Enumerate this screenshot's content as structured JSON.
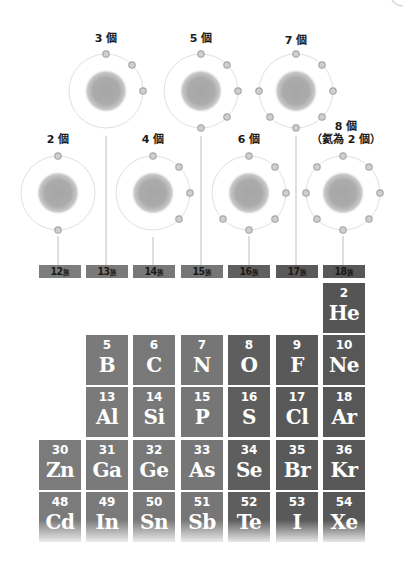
{
  "diagram": {
    "colors": {
      "orbit": "#dcdcdc",
      "nucleus": "#a8a8a8",
      "electron_fill": "#c8c8c8",
      "electron_stroke": "#a0a0a0",
      "connector": "#bdbdbd",
      "group_12": "#7d7d7d",
      "group_13": "#7a7a7a",
      "group_14": "#787878",
      "group_15": "#757575",
      "group_16": "#5c5c5c",
      "group_17": "#575757",
      "group_18": "#555555"
    },
    "atoms": [
      {
        "label": "2 個",
        "group": "12",
        "electrons": 2
      },
      {
        "label": "3 個",
        "group": "13",
        "electrons": 3
      },
      {
        "label": "4 個",
        "group": "14",
        "electrons": 4
      },
      {
        "label": "5 個",
        "group": "15",
        "electrons": 5
      },
      {
        "label": "6 個",
        "group": "16",
        "electrons": 6
      },
      {
        "label": "7 個",
        "group": "17",
        "electrons": 7
      },
      {
        "label": "8 個",
        "label_line2": "（氦為 2 個）",
        "group": "18",
        "electrons": 8
      }
    ],
    "groups": [
      {
        "number": "12",
        "suffix": "族"
      },
      {
        "number": "13",
        "suffix": "族"
      },
      {
        "number": "14",
        "suffix": "族"
      },
      {
        "number": "15",
        "suffix": "族"
      },
      {
        "number": "16",
        "suffix": "族"
      },
      {
        "number": "17",
        "suffix": "族"
      },
      {
        "number": "18",
        "suffix": "族"
      }
    ],
    "elements": {
      "row1": [
        {
          "num": "2",
          "sym": "He",
          "group": "18"
        }
      ],
      "row2": [
        {
          "num": "5",
          "sym": "B",
          "group": "13"
        },
        {
          "num": "6",
          "sym": "C",
          "group": "14"
        },
        {
          "num": "7",
          "sym": "N",
          "group": "15"
        },
        {
          "num": "8",
          "sym": "O",
          "group": "16"
        },
        {
          "num": "9",
          "sym": "F",
          "group": "17"
        },
        {
          "num": "10",
          "sym": "Ne",
          "group": "18"
        }
      ],
      "row3": [
        {
          "num": "13",
          "sym": "Al",
          "group": "13"
        },
        {
          "num": "14",
          "sym": "Si",
          "group": "14"
        },
        {
          "num": "15",
          "sym": "P",
          "group": "15"
        },
        {
          "num": "16",
          "sym": "S",
          "group": "16"
        },
        {
          "num": "17",
          "sym": "Cl",
          "group": "17"
        },
        {
          "num": "18",
          "sym": "Ar",
          "group": "18"
        }
      ],
      "row4": [
        {
          "num": "30",
          "sym": "Zn",
          "group": "12"
        },
        {
          "num": "31",
          "sym": "Ga",
          "group": "13"
        },
        {
          "num": "32",
          "sym": "Ge",
          "group": "14"
        },
        {
          "num": "33",
          "sym": "As",
          "group": "15"
        },
        {
          "num": "34",
          "sym": "Se",
          "group": "16"
        },
        {
          "num": "35",
          "sym": "Br",
          "group": "17"
        },
        {
          "num": "36",
          "sym": "Kr",
          "group": "18"
        }
      ],
      "row5": [
        {
          "num": "48",
          "sym": "Cd",
          "group": "12"
        },
        {
          "num": "49",
          "sym": "In",
          "group": "13"
        },
        {
          "num": "50",
          "sym": "Sn",
          "group": "14"
        },
        {
          "num": "51",
          "sym": "Sb",
          "group": "15"
        },
        {
          "num": "52",
          "sym": "Te",
          "group": "16"
        },
        {
          "num": "53",
          "sym": "I",
          "group": "17"
        },
        {
          "num": "54",
          "sym": "Xe",
          "group": "18"
        }
      ]
    }
  }
}
